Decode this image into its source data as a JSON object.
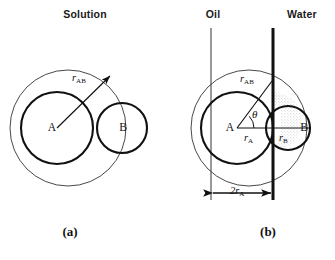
{
  "figure": {
    "width": 335,
    "height": 260,
    "background": "#ffffff",
    "stroke_color": "#111111",
    "thin_stroke_color": "#333333"
  },
  "panel_a": {
    "header": "Solution",
    "caption": "(a)",
    "labels": {
      "sphere_a": "A",
      "sphere_b": "B",
      "r_ab_symbol": "r",
      "r_ab_sub": "AB"
    },
    "geometry": {
      "outer_circle": {
        "cx": 68,
        "cy": 128,
        "r": 58,
        "stroke_width": 0.9
      },
      "circle_a": {
        "cx": 57,
        "cy": 128,
        "r": 36,
        "stroke_width": 2.1
      },
      "circle_b": {
        "cx": 122,
        "cy": 128,
        "r": 25,
        "stroke_width": 2.1
      },
      "arrow": {
        "x1": 57,
        "y1": 128,
        "x2": 110,
        "y2": 76
      }
    }
  },
  "panel_b": {
    "header_left": "Oil",
    "header_right": "Water",
    "caption": "(b)",
    "labels": {
      "sphere_a": "A",
      "sphere_b": "B",
      "theta": "θ",
      "r_ab_symbol": "r",
      "r_ab_sub": "AB",
      "r_a_symbol": "r",
      "r_a_sub": "A",
      "r_b_symbol": "r",
      "r_b_sub": "B",
      "dimension_prefix": "2",
      "dimension_symbol": "r",
      "dimension_sub": "A"
    },
    "geometry": {
      "outer_circle": {
        "cx": 249,
        "cy": 128,
        "r": 58,
        "stroke_width": 0.9
      },
      "circle_a": {
        "cx": 237,
        "cy": 128,
        "r": 36,
        "stroke_width": 2.1
      },
      "circle_b": {
        "cx": 288,
        "cy": 128,
        "r": 22,
        "stroke_width": 2.1
      },
      "oil_boundary_line": {
        "x": 211,
        "y1": 28,
        "y2": 200,
        "stroke_width": 1.0
      },
      "interface_line": {
        "x": 273,
        "y1": 28,
        "y2": 200,
        "stroke_width": 3.0
      },
      "radius_line_a": {
        "x1": 237,
        "y1": 128,
        "x2": 273,
        "y2": 128
      },
      "radius_line_b": {
        "x1": 273,
        "y1": 128,
        "x2": 310,
        "y2": 128
      },
      "r_ab_arrow": {
        "x1": 237,
        "y1": 128,
        "x2": 273,
        "y2": 79
      },
      "dimension_arrow": {
        "x1": 211,
        "x2": 273,
        "y": 193
      },
      "theta_arc": {
        "cx": 237,
        "cy": 128,
        "r": 17
      }
    }
  }
}
